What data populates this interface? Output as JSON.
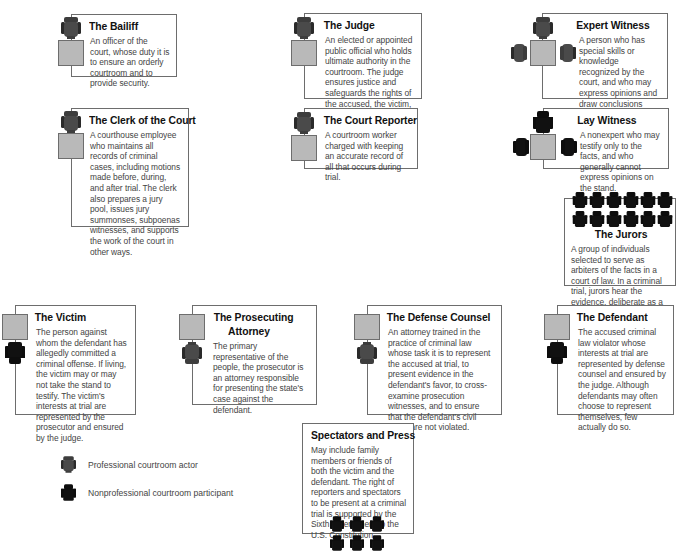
{
  "diagram": {
    "type": "courtroom-participants",
    "colors": {
      "border": "#6d6d6d",
      "desk_fill": "#b9b9b9",
      "professional_chair": "#3d3d3d",
      "nonprofessional_chair": "#0d0d0d",
      "title_text": "#111111",
      "body_text": "#444444"
    }
  },
  "roles": {
    "bailiff": {
      "title": "The Bailiff",
      "description": "An officer of the court, whose duty it is to ensure an orderly courtroom and to provide security.",
      "actor_type": "professional"
    },
    "judge": {
      "title": "The Judge",
      "description": "An elected or appointed public official who holds ultimate authority in the courtroom. The judge ensures justice and safeguards the rights of the accused, the victim, and the public.",
      "actor_type": "professional"
    },
    "expert_witness": {
      "title": "Expert Witness",
      "description": "A person who has special skills or knowledge recognized by the court, and who may express opinions and draw conclusions within their area of expertise during testimony.",
      "actor_type": "professional"
    },
    "clerk": {
      "title": "The Clerk of the Court",
      "description": "A courthouse employee who maintains all records of criminal cases, including motions made before, during, and after trial. The clerk also prepares a jury pool, issues jury summonses, subpoenas witnesses, and supports the work of the court in other ways.",
      "actor_type": "professional"
    },
    "court_reporter": {
      "title": "The Court Reporter",
      "description": "A courtroom worker charged with keeping an accurate record of all that occurs during trial.",
      "actor_type": "professional"
    },
    "lay_witness": {
      "title": "Lay Witness",
      "description": "A nonexpert who may testify only to the facts, and who generally cannot express opinions on the stand.",
      "actor_type": "nonprofessional"
    },
    "jurors": {
      "title": "The Jurors",
      "description": "A group of individuals selected to serve as arbiters of the facts in a court of law. In a criminal trial, jurors hear the evidence, deliberate as a group, and render a verdict.",
      "actor_type": "nonprofessional",
      "seat_count": 12
    },
    "victim": {
      "title": "The Victim",
      "description": "The person against whom the defendant has allegedly committed a criminal offense. If living, the victim may or may not take the stand to testify. The victim's interests at trial are represented by the prosecutor and ensured by the judge.",
      "actor_type": "nonprofessional"
    },
    "prosecutor": {
      "title_line1": "The Prosecuting",
      "title_line2": "Attorney",
      "description": "The primary representative of the people, the prosecutor is an attorney responsible for presenting the state's case against the defendant.",
      "actor_type": "professional"
    },
    "defense": {
      "title": "The Defense Counsel",
      "description": "An attorney trained in the practice of criminal law whose task it is to represent the accused at trial, to present evidence in the defendant's favor, to cross-examine prosecution witnesses, and to ensure that the defendant's civil rights are not violated.",
      "actor_type": "professional"
    },
    "defendant": {
      "title": "The Defendant",
      "description": "The accused criminal law violator whose interests at trial are represented by defense counsel and ensured by the judge. Although defendants may often choose to represent themselves, few actually do so.",
      "actor_type": "nonprofessional"
    },
    "spectators": {
      "title": "Spectators and Press",
      "description": "May include family members or friends of both the victim and the defendant. The right of reporters and spectators to be present at a criminal trial is supported by the Sixth Amendment to the U.S. Constitution.",
      "actor_type": "nonprofessional",
      "seat_count": 6
    }
  },
  "legend": {
    "professional": "Professional courtroom actor",
    "nonprofessional": "Nonprofessional courtroom participant"
  }
}
